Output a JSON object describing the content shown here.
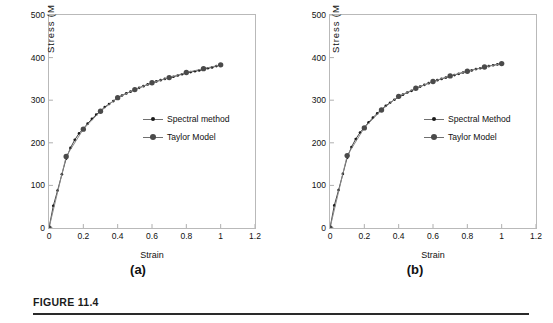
{
  "figure": {
    "caption": "FIGURE 11.4"
  },
  "panels": [
    {
      "id": "a",
      "sub_label": "(a)",
      "axes": {
        "xlabel": "Strain",
        "ylabel": "Stress (M P a)",
        "xticks": [
          "0",
          "0.2",
          "0.4",
          "0.6",
          "0.8",
          "1",
          "1.2"
        ],
        "yticks": [
          "0",
          "100",
          "200",
          "300",
          "400",
          "500"
        ]
      },
      "legend": [
        {
          "label": "Spectral method",
          "marker": "small-dot"
        },
        {
          "label": "Taylor Model",
          "marker": "large-dot"
        }
      ]
    },
    {
      "id": "b",
      "sub_label": "(b)",
      "axes": {
        "xlabel": "Strain",
        "ylabel": "Stress (M P a)",
        "xticks": [
          "0",
          "0.2",
          "0.4",
          "0.6",
          "0.8",
          "1",
          "1.2"
        ],
        "yticks": [
          "0",
          "100",
          "200",
          "300",
          "400",
          "500"
        ]
      },
      "legend": [
        {
          "label": "Spectral Method",
          "marker": "small-dot"
        },
        {
          "label": "Taylor Model",
          "marker": "large-dot"
        }
      ]
    }
  ],
  "chart_data": [
    {
      "type": "line",
      "panel": "a",
      "title": "",
      "xlabel": "Strain",
      "ylabel": "Stress (M P a)",
      "xlim": [
        0,
        1.2
      ],
      "ylim": [
        0,
        500
      ],
      "xticks": [
        0,
        0.2,
        0.4,
        0.6,
        0.8,
        1,
        1.2
      ],
      "yticks": [
        0,
        100,
        200,
        300,
        400,
        500
      ],
      "grid": false,
      "legend_position": "center-right",
      "series": [
        {
          "name": "Spectral method",
          "marker": "small-dot",
          "color": "#1a1a1a",
          "x": [
            0,
            0.025,
            0.05,
            0.075,
            0.1,
            0.125,
            0.15,
            0.175,
            0.2,
            0.225,
            0.25,
            0.275,
            0.3,
            0.325,
            0.35,
            0.375,
            0.4,
            0.425,
            0.45,
            0.475,
            0.5,
            0.525,
            0.55,
            0.575,
            0.6,
            0.625,
            0.65,
            0.675,
            0.7,
            0.725,
            0.75,
            0.775,
            0.8,
            0.825,
            0.85,
            0.875,
            0.9,
            0.925,
            0.95,
            0.975,
            1.0
          ],
          "y": [
            0,
            52,
            88,
            126,
            163,
            188,
            207,
            222,
            233,
            245,
            256,
            266,
            275,
            284,
            291,
            298,
            305,
            311,
            316,
            320,
            324,
            329,
            333,
            337,
            340,
            344,
            347,
            350,
            352,
            355,
            358,
            361,
            364,
            366,
            368,
            370,
            372,
            375,
            377,
            380,
            383
          ]
        },
        {
          "name": "Taylor Model",
          "marker": "large-dot",
          "color": "#4a4a4a",
          "x": [
            0,
            0.1,
            0.2,
            0.3,
            0.4,
            0.5,
            0.6,
            0.7,
            0.8,
            0.9,
            1.0
          ],
          "y": [
            0,
            168,
            232,
            274,
            306,
            325,
            341,
            353,
            365,
            374,
            383
          ]
        }
      ]
    },
    {
      "type": "line",
      "panel": "b",
      "title": "",
      "xlabel": "Strain",
      "ylabel": "Stress (M P a)",
      "xlim": [
        0,
        1.2
      ],
      "ylim": [
        0,
        500
      ],
      "xticks": [
        0,
        0.2,
        0.4,
        0.6,
        0.8,
        1,
        1.2
      ],
      "yticks": [
        0,
        100,
        200,
        300,
        400,
        500
      ],
      "grid": false,
      "legend_position": "center-right",
      "series": [
        {
          "name": "Spectral Method",
          "marker": "small-dot",
          "color": "#1a1a1a",
          "x": [
            0,
            0.025,
            0.05,
            0.075,
            0.1,
            0.125,
            0.15,
            0.175,
            0.2,
            0.225,
            0.25,
            0.275,
            0.3,
            0.325,
            0.35,
            0.375,
            0.4,
            0.425,
            0.45,
            0.475,
            0.5,
            0.525,
            0.55,
            0.575,
            0.6,
            0.625,
            0.65,
            0.675,
            0.7,
            0.725,
            0.75,
            0.775,
            0.8,
            0.825,
            0.85,
            0.875,
            0.9,
            0.925,
            0.95,
            0.975,
            1.0
          ],
          "y": [
            0,
            53,
            89,
            127,
            165,
            190,
            209,
            224,
            236,
            248,
            259,
            269,
            278,
            287,
            294,
            301,
            307,
            313,
            318,
            322,
            327,
            332,
            336,
            340,
            344,
            347,
            350,
            353,
            356,
            359,
            362,
            365,
            368,
            370,
            373,
            375,
            377,
            380,
            382,
            384,
            386
          ]
        },
        {
          "name": "Taylor Model",
          "marker": "large-dot",
          "color": "#4a4a4a",
          "x": [
            0,
            0.1,
            0.2,
            0.3,
            0.4,
            0.5,
            0.6,
            0.7,
            0.8,
            0.9,
            1.0
          ],
          "y": [
            0,
            170,
            235,
            277,
            309,
            328,
            344,
            357,
            368,
            378,
            386
          ]
        }
      ]
    }
  ]
}
